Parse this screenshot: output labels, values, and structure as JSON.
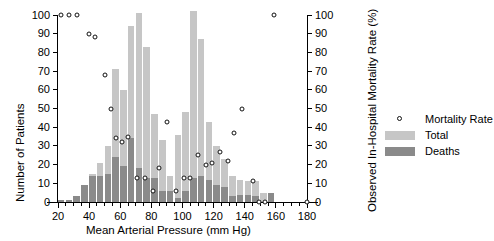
{
  "chart_data": {
    "type": "bar",
    "title": "",
    "xlabel": "Mean Arterial Pressure (mm Hg)",
    "ylabel": "Number of Patients",
    "y2label": "Observed In-Hospital Mortality Rate (%)",
    "xlim": [
      17,
      183
    ],
    "ylim": [
      0,
      100
    ],
    "y2lim": [
      0,
      100
    ],
    "xticks_major": [
      20,
      40,
      60,
      80,
      100,
      120,
      140,
      160,
      180
    ],
    "xticks_minor": [
      25,
      30,
      35,
      45,
      50,
      55,
      65,
      70,
      75,
      85,
      90,
      95,
      105,
      110,
      115,
      125,
      130,
      135,
      145,
      150,
      155,
      165,
      170,
      175
    ],
    "yticks": [
      0,
      10,
      20,
      30,
      40,
      50,
      60,
      70,
      80,
      90,
      100
    ],
    "y2ticks": [
      0,
      10,
      20,
      30,
      40,
      50,
      60,
      70,
      80,
      90,
      100
    ],
    "grid": false,
    "legend_position": "right",
    "bin_width": 5,
    "bin_centers": [
      22,
      27,
      32,
      37,
      42,
      47,
      52,
      57,
      62,
      67,
      72,
      77,
      82,
      87,
      92,
      97,
      102,
      107,
      112,
      117,
      122,
      127,
      132,
      137,
      142,
      147,
      152,
      157
    ],
    "series": [
      {
        "name": "Total",
        "color": "#c6c6c6",
        "values": [
          1,
          1,
          3,
          9,
          15,
          21,
          30,
          71,
          60,
          94,
          101,
          83,
          47,
          33,
          14,
          36,
          48,
          102,
          87,
          43,
          30,
          23,
          14,
          12,
          11,
          11,
          5,
          5
        ]
      },
      {
        "name": "Deaths",
        "color": "#8a8a8a",
        "values": [
          1,
          1,
          3,
          9,
          14,
          14,
          15,
          24,
          19,
          34,
          18,
          13,
          13,
          6,
          6,
          2,
          6,
          13,
          14,
          12,
          9,
          8,
          3,
          4,
          4,
          3,
          0,
          5
        ]
      }
    ],
    "mortality_rate": {
      "name": "Mortality Rate",
      "marker": "open-circle",
      "color": "#111111",
      "points": [
        {
          "x": 22,
          "y": 100
        },
        {
          "x": 27,
          "y": 100
        },
        {
          "x": 32,
          "y": 100
        },
        {
          "x": 40,
          "y": 90
        },
        {
          "x": 44,
          "y": 88
        },
        {
          "x": 50,
          "y": 68
        },
        {
          "x": 54,
          "y": 50
        },
        {
          "x": 57,
          "y": 34
        },
        {
          "x": 61,
          "y": 32
        },
        {
          "x": 65,
          "y": 35
        },
        {
          "x": 71,
          "y": 13
        },
        {
          "x": 76,
          "y": 13
        },
        {
          "x": 81,
          "y": 6
        },
        {
          "x": 85,
          "y": 18
        },
        {
          "x": 90,
          "y": 43
        },
        {
          "x": 96,
          "y": 6
        },
        {
          "x": 101,
          "y": 13
        },
        {
          "x": 105,
          "y": 13
        },
        {
          "x": 110,
          "y": 25
        },
        {
          "x": 115,
          "y": 20
        },
        {
          "x": 119,
          "y": 21
        },
        {
          "x": 124,
          "y": 27
        },
        {
          "x": 129,
          "y": 22
        },
        {
          "x": 133,
          "y": 37
        },
        {
          "x": 138,
          "y": 50
        },
        {
          "x": 145,
          "y": 11
        },
        {
          "x": 149,
          "y": 0
        },
        {
          "x": 153,
          "y": 0
        },
        {
          "x": 159,
          "y": 100
        },
        {
          "x": 180,
          "y": 0
        }
      ]
    }
  },
  "legend": {
    "items": [
      {
        "label": "Mortality Rate",
        "type": "dot"
      },
      {
        "label": "Total",
        "type": "swatch",
        "color": "#c6c6c6"
      },
      {
        "label": "Deaths",
        "type": "swatch",
        "color": "#8a8a8a"
      }
    ]
  }
}
